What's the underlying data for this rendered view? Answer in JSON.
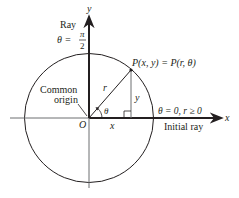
{
  "diagram": {
    "axes": {
      "x_label": "x",
      "y_label": "y",
      "origin_label": "O"
    },
    "rays": {
      "vertical_ray_label": "Ray",
      "vertical_theta_prefix": "θ =",
      "vertical_theta_numerator": "π",
      "vertical_theta_denominator": "2",
      "initial_ray_label": "Initial ray",
      "initial_condition": "θ = 0, r ≥ 0"
    },
    "point": {
      "label": "P(x, y) = P(r, θ)"
    },
    "segments": {
      "radius_label": "r",
      "angle_label": "θ",
      "x_leg_label": "x",
      "y_leg_label": "y"
    },
    "annotations": {
      "origin_line1": "Common",
      "origin_line2": "origin"
    },
    "colors": {
      "line": "#231f20",
      "light_line": "#6d6e71",
      "background": "#ffffff"
    }
  }
}
